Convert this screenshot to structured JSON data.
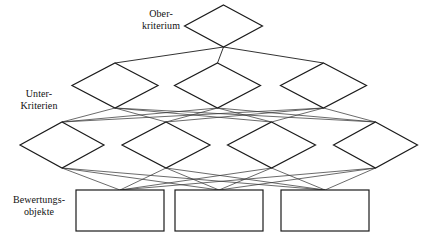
{
  "diagram": {
    "type": "hierarchy-diagram",
    "canvas": {
      "width": 430,
      "height": 240
    },
    "colors": {
      "background": "#ffffff",
      "node_stroke": "#1b1b1b",
      "node_fill": "#ffffff",
      "edge_stroke": "#3a3a3a",
      "text": "#111111"
    },
    "row_labels": [
      {
        "id": "ober",
        "text": "Ober-\nkriterium"
      },
      {
        "id": "unter",
        "text": "Unter-\nKriterien"
      },
      {
        "id": "bewertung",
        "text": "Bewertungs-\nobjekte"
      }
    ],
    "levels": [
      {
        "id": "level-1",
        "label_id": "ober",
        "shape": "diamond",
        "count": 1,
        "nodes": [
          {
            "id": "k0",
            "cx": 223.5,
            "cy": 26,
            "rx": 39,
            "ry": 21,
            "text": ""
          }
        ]
      },
      {
        "id": "level-2",
        "label_id": "unter",
        "shape": "diamond",
        "count": 3,
        "nodes": [
          {
            "id": "k1",
            "cx": 115,
            "cy": 85.5,
            "rx": 43,
            "ry": 22.5,
            "text": ""
          },
          {
            "id": "k2",
            "cx": 217.5,
            "cy": 85.5,
            "rx": 43,
            "ry": 22.5,
            "text": ""
          },
          {
            "id": "k3",
            "cx": 323.5,
            "cy": 85.5,
            "rx": 43,
            "ry": 22.5,
            "text": ""
          }
        ]
      },
      {
        "id": "level-3",
        "label_id": "unter",
        "shape": "diamond",
        "count": 4,
        "nodes": [
          {
            "id": "k4",
            "cx": 62,
            "cy": 145,
            "rx": 42,
            "ry": 23,
            "text": ""
          },
          {
            "id": "k5",
            "cx": 166,
            "cy": 145,
            "rx": 44,
            "ry": 23,
            "text": ""
          },
          {
            "id": "k6",
            "cx": 271.5,
            "cy": 145,
            "rx": 44,
            "ry": 23,
            "text": ""
          },
          {
            "id": "k7",
            "cx": 375.5,
            "cy": 145,
            "rx": 42,
            "ry": 23,
            "text": ""
          }
        ]
      },
      {
        "id": "level-4",
        "label_id": "bewertung",
        "shape": "rect",
        "count": 3,
        "nodes": [
          {
            "id": "b0",
            "x": 76,
            "y": 190,
            "w": 88,
            "h": 41,
            "text": ""
          },
          {
            "id": "b1",
            "x": 175,
            "y": 190,
            "w": 88,
            "h": 41,
            "text": ""
          },
          {
            "id": "b2",
            "x": 281,
            "y": 190,
            "w": 88,
            "h": 41,
            "text": ""
          }
        ]
      }
    ],
    "edges": [
      {
        "from": "k0",
        "to": "k1",
        "kind": "main"
      },
      {
        "from": "k0",
        "to": "k2",
        "kind": "main"
      },
      {
        "from": "k0",
        "to": "k3",
        "kind": "main"
      },
      {
        "from": "k1",
        "to": "k4",
        "kind": "thin"
      },
      {
        "from": "k1",
        "to": "k5",
        "kind": "thin"
      },
      {
        "from": "k1",
        "to": "k6",
        "kind": "thin"
      },
      {
        "from": "k1",
        "to": "k7",
        "kind": "thin"
      },
      {
        "from": "k2",
        "to": "k4",
        "kind": "thin"
      },
      {
        "from": "k2",
        "to": "k5",
        "kind": "thin"
      },
      {
        "from": "k2",
        "to": "k6",
        "kind": "thin"
      },
      {
        "from": "k2",
        "to": "k7",
        "kind": "thin"
      },
      {
        "from": "k3",
        "to": "k4",
        "kind": "thin"
      },
      {
        "from": "k3",
        "to": "k5",
        "kind": "thin"
      },
      {
        "from": "k3",
        "to": "k6",
        "kind": "thin"
      },
      {
        "from": "k3",
        "to": "k7",
        "kind": "thin"
      },
      {
        "from": "k4",
        "to": "b0",
        "kind": "thin"
      },
      {
        "from": "k4",
        "to": "b1",
        "kind": "thin"
      },
      {
        "from": "k4",
        "to": "b2",
        "kind": "thin"
      },
      {
        "from": "k5",
        "to": "b0",
        "kind": "thin"
      },
      {
        "from": "k5",
        "to": "b1",
        "kind": "thin"
      },
      {
        "from": "k5",
        "to": "b2",
        "kind": "thin"
      },
      {
        "from": "k6",
        "to": "b0",
        "kind": "thin"
      },
      {
        "from": "k6",
        "to": "b1",
        "kind": "thin"
      },
      {
        "from": "k6",
        "to": "b2",
        "kind": "thin"
      },
      {
        "from": "k7",
        "to": "b0",
        "kind": "thin"
      },
      {
        "from": "k7",
        "to": "b1",
        "kind": "thin"
      },
      {
        "from": "k7",
        "to": "b2",
        "kind": "thin"
      }
    ]
  }
}
